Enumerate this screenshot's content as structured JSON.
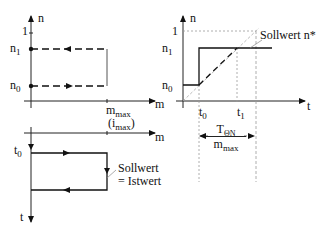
{
  "top_left_plot": {
    "y_axis_label": "n",
    "x_axis_label": "m",
    "y_ticks": {
      "one": "1",
      "n1": "n",
      "n1_sub": "1",
      "n0": "n",
      "n0_sub": "0"
    },
    "x_ticks": {
      "mmax": "m",
      "mmax_sub": "max",
      "imax_open": "(i",
      "imax_sub": "max",
      "imax_close": ")"
    }
  },
  "top_right_plot": {
    "y_axis_label": "n",
    "x_axis_label": "t",
    "y_ticks": {
      "one": "1",
      "n1": "n",
      "n1_sub": "1",
      "n0": "n",
      "n0_sub": "0"
    },
    "x_ticks": {
      "t0": "t",
      "t0_sub": "0",
      "t1": "t",
      "t1_sub": "1"
    },
    "setpoint_label": "Sollwert  n*",
    "dimension": {
      "numerator": "T",
      "numerator_sub": "ΘN",
      "denominator": "m",
      "denominator_sub": "max"
    }
  },
  "bottom_left_plot": {
    "y_axis_label": "t",
    "x_axis_label": "m",
    "y_ticks": {
      "t0": "t",
      "t0_sub": "0"
    },
    "annotation_line1": "Sollwert",
    "annotation_line2": "= Istwert"
  },
  "colors": {
    "line": "#111111",
    "dashed": "#333333",
    "guide": "#888888"
  }
}
